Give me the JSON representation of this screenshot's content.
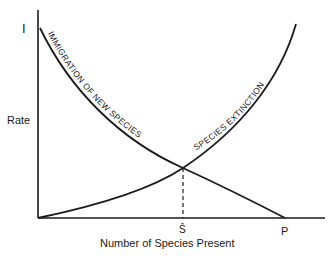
{
  "diagram": {
    "type": "island-biogeography-equilibrium",
    "y_axis": {
      "label": "Rate",
      "intercept_label": "I"
    },
    "x_axis": {
      "label": "Number of Species Present",
      "equilibrium_label": "Ŝ",
      "pool_label": "P"
    },
    "curves": [
      {
        "name": "immigration",
        "label": "IMMIGRATION OF NEW SPECIES",
        "trend": "decreasing from I to P"
      },
      {
        "name": "extinction",
        "label": "SPECIES EXTINCTION",
        "trend": "increasing from origin"
      }
    ],
    "equilibrium": {
      "description": "intersection of immigration and extinction curves, dashed line to Ŝ"
    },
    "colors": {
      "ink": "#1a1a1a",
      "background": "#ffffff"
    }
  }
}
